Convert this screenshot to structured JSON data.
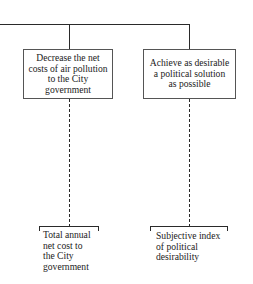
{
  "diagram": {
    "objectives": [
      {
        "text": "Decrease the net\ncosts of air pollution\nto the City\ngovernment"
      },
      {
        "text": "Achieve as desirable\na political solution\nas possible"
      }
    ],
    "attributes": [
      {
        "text": "Total annual\nnet cost to\nthe City\ngovernment"
      },
      {
        "text": "Subjective index\nof political\ndesirability"
      }
    ]
  }
}
